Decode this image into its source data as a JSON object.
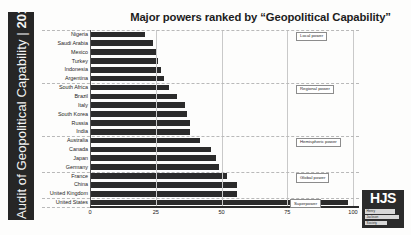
{
  "banner": {
    "prefix": "Audit of Geopolitical Capability | ",
    "year": "2019"
  },
  "title": "Major powers ranked by “Geopolitical Capability”",
  "logo": {
    "wordmark": "HJS",
    "lines": [
      "Henry",
      "Jackson",
      "Society"
    ]
  },
  "tiers": [
    {
      "label": "Local power"
    },
    {
      "label": "Regional power"
    },
    {
      "label": "Hemispheric power"
    },
    {
      "label": "Global power"
    },
    {
      "label": "Superpower"
    }
  ],
  "chart_data": {
    "type": "bar",
    "orientation": "horizontal",
    "title": "Major powers ranked by “Geopolitical Capability”",
    "xlabel": "",
    "ylabel": "",
    "xlim": [
      0,
      100
    ],
    "ticks": [
      0,
      25,
      50,
      75,
      100
    ],
    "tick_labels": [
      "0",
      "25",
      "50",
      "75",
      "100"
    ],
    "grid": "vertical",
    "legend": "none",
    "bar_color": "#2b2b2b",
    "categories": [
      "Nigeria",
      "Saudi Arabia",
      "Mexico",
      "Turkey",
      "Indonesia",
      "Argentina",
      "South Africa",
      "Brazil",
      "Italy",
      "South Korea",
      "Russia",
      "India",
      "Australia",
      "Canada",
      "Japan",
      "Germany",
      "France",
      "China",
      "United Kingdom",
      "United States"
    ],
    "values": [
      21,
      24,
      25,
      26,
      27,
      28,
      30,
      33,
      36,
      37,
      38,
      38,
      42,
      46,
      48,
      49,
      52,
      56,
      56,
      98
    ],
    "annotations": [
      {
        "text": "Local power",
        "group": [
          "Nigeria",
          "Saudi Arabia",
          "Mexico",
          "Turkey",
          "Indonesia",
          "Argentina"
        ]
      },
      {
        "text": "Regional power",
        "group": [
          "South Africa",
          "Brazil",
          "Italy",
          "South Korea",
          "Russia",
          "India"
        ]
      },
      {
        "text": "Hemispheric power",
        "group": [
          "Australia",
          "Canada",
          "Japan",
          "Germany"
        ]
      },
      {
        "text": "Global power",
        "group": [
          "France",
          "China",
          "United Kingdom"
        ]
      },
      {
        "text": "Superpower",
        "group": [
          "United States"
        ]
      }
    ]
  }
}
